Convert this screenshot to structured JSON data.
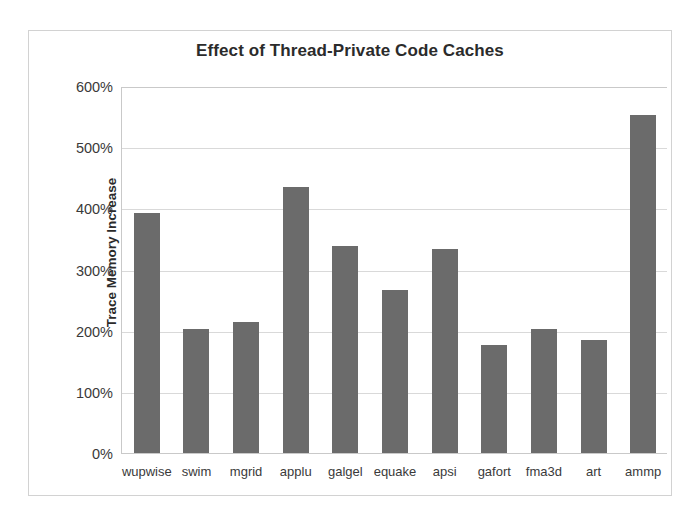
{
  "chart_data": {
    "type": "bar",
    "title": "Effect of Thread-Private Code Caches",
    "xlabel": "",
    "ylabel": "Trace Memory Increase",
    "categories": [
      "wupwise",
      "swim",
      "mgrid",
      "applu",
      "galgel",
      "equake",
      "apsi",
      "gafort",
      "fma3d",
      "art",
      "ammp"
    ],
    "values": [
      393,
      203,
      215,
      435,
      339,
      266,
      333,
      177,
      203,
      185,
      552
    ],
    "value_unit": "%",
    "ylim": [
      0,
      600
    ],
    "ytick_values": [
      0,
      100,
      200,
      300,
      400,
      500,
      600
    ],
    "ytick_labels": [
      "0%",
      "100%",
      "200%",
      "300%",
      "400%",
      "500%",
      "600%"
    ],
    "grid": "horizontal",
    "legend": "none",
    "bar_color": "#6b6b6b",
    "gridline_color": "#d9d9d9",
    "axis_color": "#c9c9c9",
    "frame_border_color": "#d2d2d2",
    "background_color": "#ffffff",
    "text_color": "#3a3a3a",
    "title_color": "#2b2b2b"
  }
}
